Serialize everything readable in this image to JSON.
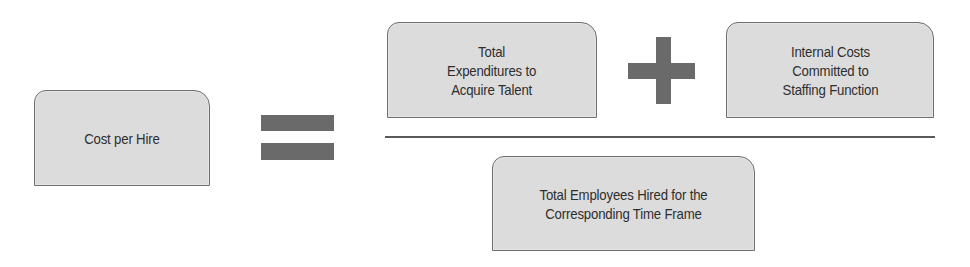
{
  "diagram": {
    "result": {
      "label": "Cost per Hire"
    },
    "operators": {
      "equals": "equals-sign",
      "plus": "plus-sign",
      "fraction": "fraction-bar"
    },
    "numerator": [
      {
        "label": "Total\nExpenditures to\nAcquire Talent"
      },
      {
        "label": "Internal Costs\nCommitted to\nStaffing Function"
      }
    ],
    "denominator": {
      "label": "Total Employees Hired for the\nCorresponding Time Frame"
    },
    "colors": {
      "box_fill": "#dcdcdc",
      "box_border": "#6e6e6e",
      "operator": "#6a6a6a",
      "text": "#2e2e2e"
    }
  }
}
